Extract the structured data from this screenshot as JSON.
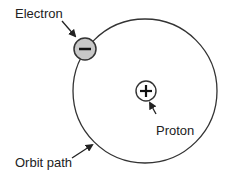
{
  "diagram": {
    "labels": {
      "electron": "Electron",
      "proton": "Proton",
      "orbit": "Orbit path"
    },
    "symbols": {
      "electron": "−",
      "proton": "+"
    },
    "colors": {
      "stroke": "#333333",
      "electron_fill": "#c8c8c8",
      "proton_fill": "#ffffff",
      "text": "#222222"
    }
  }
}
